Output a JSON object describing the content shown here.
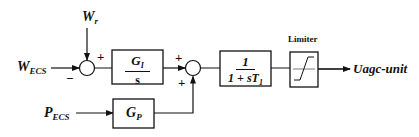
{
  "inputs": {
    "w_ecs": {
      "main": "W",
      "sub": "ECS"
    },
    "w_r": {
      "main": "W",
      "sub": "r"
    },
    "p_ecs": {
      "main": "P",
      "sub": "ECS"
    }
  },
  "summing_junction_1": {
    "sign_top": "+",
    "sign_left": "−",
    "sign_right": "+"
  },
  "summing_junction_2": {
    "sign_left": "+",
    "sign_bottom": "+"
  },
  "blocks": {
    "integral": {
      "num_main": "G",
      "num_sub": "I",
      "den": "s"
    },
    "proportional": {
      "main": "G",
      "sub": "P"
    },
    "lag": {
      "num": "1",
      "den_main": "1 + sT",
      "den_sub": "1"
    },
    "limiter": {
      "label": "Limiter"
    }
  },
  "output": {
    "label": "Uagc-unit"
  },
  "colors": {
    "line": "#111111",
    "background": "#ffffff"
  }
}
